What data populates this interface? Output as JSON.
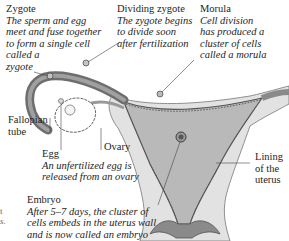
{
  "diagram": {
    "labels": {
      "zygote": {
        "title": "Zygote",
        "lines": [
          "The sperm and egg",
          "meet and fuse together",
          "to form a single cell",
          "called a",
          "zygote"
        ]
      },
      "dividing_zygote": {
        "title": "Dividing zygote",
        "lines": [
          "The zygote begins",
          "to divide soon",
          "after fertilization"
        ]
      },
      "morula": {
        "title": "Morula",
        "lines": [
          "Cell division",
          "has produced a",
          "cluster of cells",
          "called a morula"
        ]
      },
      "fallopian_tube": {
        "lines": [
          "Fallopian",
          "tube"
        ]
      },
      "ovary": {
        "title": "Ovary"
      },
      "egg": {
        "title": "Egg",
        "lines": [
          "An unfertilized egg is",
          "released from an ovary"
        ]
      },
      "lining": {
        "lines": [
          "Lining",
          "of the",
          "uterus"
        ]
      },
      "embryo": {
        "title": "Embryo",
        "lines": [
          "After 5–7 days, the cluster of",
          "cells embeds in the uterus wall",
          "and is now called an embryo"
        ]
      },
      "cut_off_left": {
        "lines": [
          "t",
          "s."
        ]
      }
    },
    "colors": {
      "tissue_light": "#d9d9d9",
      "tissue_mid": "#a8a8a8",
      "tissue_dark": "#6e6e6e",
      "outline": "#555555",
      "text": "#1e1e1e"
    }
  }
}
